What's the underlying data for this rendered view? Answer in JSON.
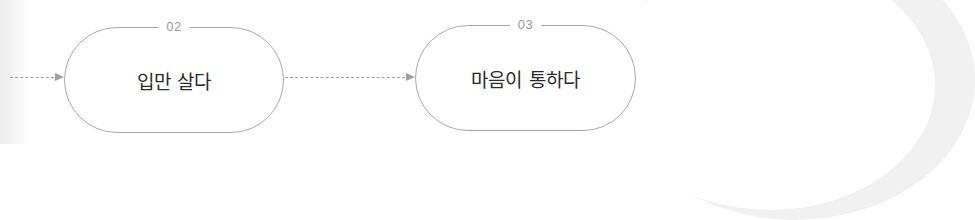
{
  "diagram": {
    "steps": [
      {
        "number": "02",
        "label": "입만 살다"
      },
      {
        "number": "03",
        "label": "마음이 통하다"
      }
    ],
    "connector_style": "dashed-arrow",
    "colors": {
      "border": "#a8a8a8",
      "number_text": "#9a9a9a",
      "label_text": "#2a2a2a",
      "arrow": "#a0a0a0"
    }
  }
}
